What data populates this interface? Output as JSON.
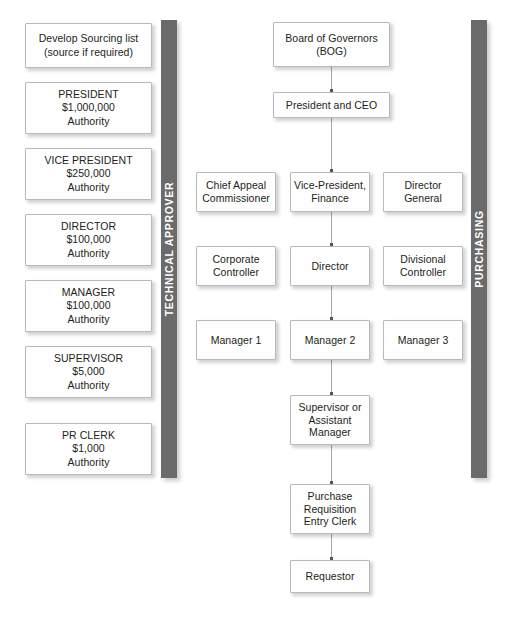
{
  "diagram": {
    "colors": {
      "bar_fill": "#6b6b6b",
      "bar_text": "#ffffff",
      "box_fill": "#fefefe",
      "box_border": "#b9b9b9",
      "box_text": "#231f20",
      "connector": "#a6a6a6",
      "connector_head": "#555555",
      "background": "#ffffff"
    }
  },
  "authority_column": {
    "name": "approval-authority-levels",
    "boxes": [
      {
        "id": "develop-sourcing-list",
        "text": "Develop Sourcing list\n(source if required)",
        "x": 25,
        "y": 23,
        "w": 127,
        "h": 45
      },
      {
        "id": "president-authority",
        "text": "PRESIDENT\n$1,000,000\nAuthority",
        "role": "PRESIDENT",
        "amount": "$1,000,000",
        "suffix": "Authority",
        "x": 25,
        "y": 82,
        "w": 127,
        "h": 52
      },
      {
        "id": "vice-president-authority",
        "text": "VICE PRESIDENT\n$250,000\nAuthority",
        "role": "VICE PRESIDENT",
        "amount": "$250,000",
        "suffix": "Authority",
        "x": 25,
        "y": 148,
        "w": 127,
        "h": 52
      },
      {
        "id": "director-authority",
        "text": "DIRECTOR\n$100,000\nAuthority",
        "role": "DIRECTOR",
        "amount": "$100,000",
        "suffix": "Authority",
        "x": 25,
        "y": 214,
        "w": 127,
        "h": 52
      },
      {
        "id": "manager-authority",
        "text": "MANAGER\n$100,000\nAuthority",
        "role": "MANAGER",
        "amount": "$100,000",
        "suffix": "Authority",
        "x": 25,
        "y": 280,
        "w": 127,
        "h": 52
      },
      {
        "id": "supervisor-authority",
        "text": "SUPERVISOR\n$5,000\nAuthority",
        "role": "SUPERVISOR",
        "amount": "$5,000",
        "suffix": "Authority",
        "x": 25,
        "y": 346,
        "w": 127,
        "h": 52
      },
      {
        "id": "pr-clerk-authority",
        "text": "PR CLERK\n$1,000\nAuthority",
        "role": "PR CLERK",
        "amount": "$1,000",
        "suffix": "Authority",
        "x": 25,
        "y": 423,
        "w": 127,
        "h": 52
      }
    ]
  },
  "bars": [
    {
      "id": "technical-approver-bar",
      "label": "TECHNICAL APPROVER",
      "x": 161,
      "y": 20,
      "w": 16,
      "h": 458
    },
    {
      "id": "purchasing-bar",
      "label": "PURCHASING",
      "x": 471,
      "y": 20,
      "w": 16,
      "h": 458
    }
  ],
  "org_chart": {
    "name": "organization-hierarchy",
    "boxes": [
      {
        "id": "board-of-governors",
        "text": "Board of Governors\n(BOG)",
        "x": 273,
        "y": 22,
        "w": 117,
        "h": 45,
        "col": "center"
      },
      {
        "id": "president-and-ceo",
        "text": "President and CEO",
        "x": 273,
        "y": 92,
        "w": 117,
        "h": 26,
        "col": "center"
      },
      {
        "id": "chief-appeal-commissioner",
        "text": "Chief Appeal\nCommissioner",
        "x": 196,
        "y": 172,
        "w": 80,
        "h": 40,
        "col": "left"
      },
      {
        "id": "vice-president-finance",
        "text": "Vice-President,\nFinance",
        "x": 290,
        "y": 172,
        "w": 80,
        "h": 40,
        "col": "center"
      },
      {
        "id": "director-general",
        "text": "Director\nGeneral",
        "x": 383,
        "y": 172,
        "w": 80,
        "h": 40,
        "col": "right"
      },
      {
        "id": "corporate-controller",
        "text": "Corporate\nController",
        "x": 196,
        "y": 246,
        "w": 80,
        "h": 40,
        "col": "left"
      },
      {
        "id": "director",
        "text": "Director",
        "x": 290,
        "y": 246,
        "w": 80,
        "h": 40,
        "col": "center"
      },
      {
        "id": "divisional-controller",
        "text": "Divisional\nController",
        "x": 383,
        "y": 246,
        "w": 80,
        "h": 40,
        "col": "right"
      },
      {
        "id": "manager-1",
        "text": "Manager 1",
        "x": 196,
        "y": 320,
        "w": 80,
        "h": 40,
        "col": "left"
      },
      {
        "id": "manager-2",
        "text": "Manager 2",
        "x": 290,
        "y": 320,
        "w": 80,
        "h": 40,
        "col": "center"
      },
      {
        "id": "manager-3",
        "text": "Manager 3",
        "x": 383,
        "y": 320,
        "w": 80,
        "h": 40,
        "col": "right"
      },
      {
        "id": "supervisor-or-assistant-manager",
        "text": "Supervisor or\nAssistant\nManager",
        "x": 290,
        "y": 395,
        "w": 80,
        "h": 50,
        "col": "center"
      },
      {
        "id": "purchase-requisition-entry-clerk",
        "text": "Purchase\nRequisition\nEntry Clerk",
        "x": 290,
        "y": 484,
        "w": 80,
        "h": 50,
        "col": "center"
      },
      {
        "id": "requestor",
        "text": "Requestor",
        "x": 290,
        "y": 560,
        "w": 80,
        "h": 33,
        "col": "center"
      }
    ],
    "connectors": [
      {
        "id": "conn-bog-to-ceo",
        "from": "board-of-governors",
        "to": "president-and-ceo",
        "x": 331,
        "y": 67,
        "len": 25
      },
      {
        "id": "conn-ceo-to-vp-finance",
        "from": "president-and-ceo",
        "to": "vice-president-finance",
        "x": 331,
        "y": 118,
        "len": 54
      },
      {
        "id": "conn-vp-finance-to-director",
        "from": "vice-president-finance",
        "to": "director",
        "x": 331,
        "y": 212,
        "len": 34
      },
      {
        "id": "conn-director-to-manager-2",
        "from": "director",
        "to": "manager-2",
        "x": 331,
        "y": 286,
        "len": 34
      },
      {
        "id": "conn-manager-2-to-supervisor",
        "from": "manager-2",
        "to": "supervisor-or-assistant-manager",
        "x": 331,
        "y": 360,
        "len": 35
      },
      {
        "id": "conn-supervisor-to-pr-clerk",
        "from": "supervisor-or-assistant-manager",
        "to": "purchase-requisition-entry-clerk",
        "x": 331,
        "y": 445,
        "len": 39
      },
      {
        "id": "conn-pr-clerk-to-requestor",
        "from": "purchase-requisition-entry-clerk",
        "to": "requestor",
        "x": 331,
        "y": 534,
        "len": 26
      }
    ]
  }
}
